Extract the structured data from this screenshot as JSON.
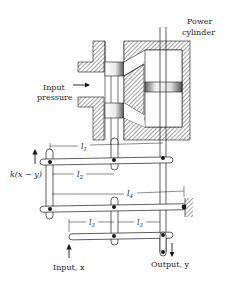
{
  "diagram": {
    "type": "hydraulic servo mechanism with lever linkage",
    "labels": {
      "power_cylinder_line1": "Power",
      "power_cylinder_line2": "cylinder",
      "input_pressure_line1": "Input",
      "input_pressure_line2": "pressure",
      "feedback_force": "k(x − y)",
      "l1": "l",
      "l1_sub": "1",
      "l2": "l",
      "l2_sub": "2",
      "l3a": "l",
      "l3a_sub": "3",
      "l3b": "l",
      "l3b_sub": "3",
      "l4": "l",
      "l4_sub": "4",
      "input": "Input, x",
      "output": "Output, y"
    },
    "colors": {
      "line": "#1a1a1a",
      "hatch": "#555555",
      "background": "#ffffff"
    }
  }
}
